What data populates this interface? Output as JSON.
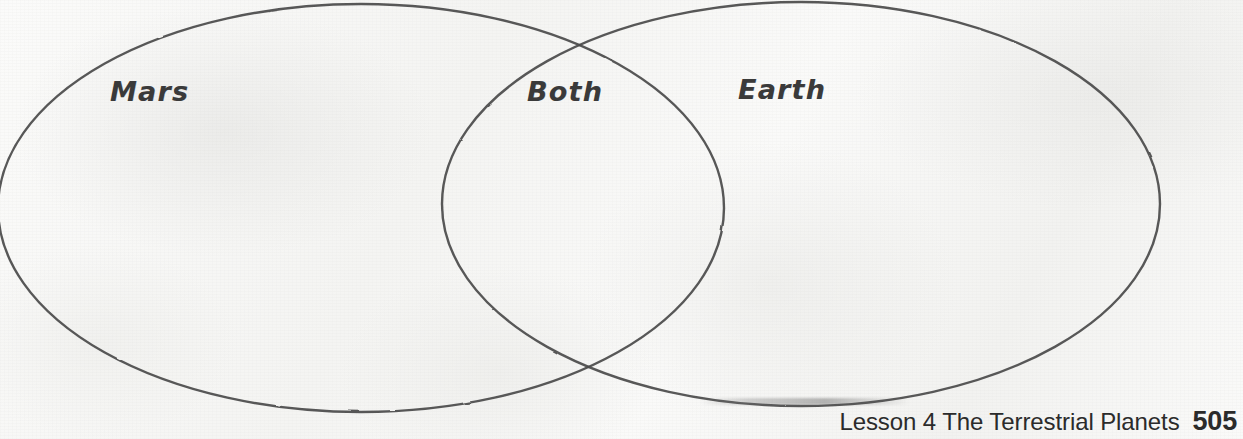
{
  "page": {
    "width": 1243,
    "height": 439,
    "background_color": "#f8f8f7",
    "ink_color": "#4a4a4a"
  },
  "diagram": {
    "type": "venn",
    "label_color": "#3a3a3a",
    "sets": [
      {
        "name": "mars",
        "label": "Mars",
        "label_x": 110,
        "label_y": 76,
        "ellipse": {
          "cx": 361,
          "cy": 208,
          "rx": 363,
          "ry": 204
        }
      },
      {
        "name": "earth",
        "label": "Earth",
        "label_x": 738,
        "label_y": 74,
        "ellipse": {
          "cx": 801,
          "cy": 204,
          "rx": 359,
          "ry": 202
        }
      }
    ],
    "intersection": {
      "name": "both",
      "label": "Both",
      "label_x": 527,
      "label_y": 76
    }
  },
  "footer": {
    "lesson_title": "Lesson 4 The Terrestrial Planets",
    "page_number": "505"
  }
}
